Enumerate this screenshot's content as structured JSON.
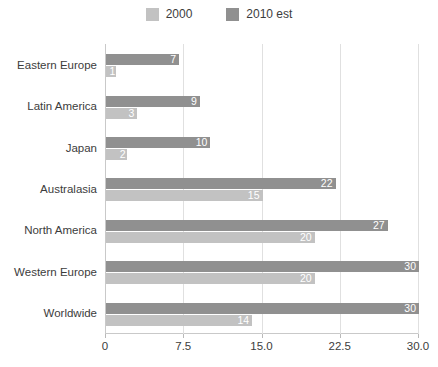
{
  "legend": {
    "entries": [
      {
        "label": "2000",
        "color": "#c2c2c2"
      },
      {
        "label": "2010 est",
        "color": "#909090"
      }
    ]
  },
  "axis": {
    "x_ticks": [
      "0",
      "7.5",
      "15.0",
      "22.5",
      "30.0"
    ]
  },
  "chart_data": {
    "type": "bar",
    "orientation": "horizontal",
    "title": "",
    "xlabel": "",
    "ylabel": "",
    "xlim": [
      0,
      30
    ],
    "grid": true,
    "legend_position": "top-center",
    "categories": [
      "Eastern Europe",
      "Latin America",
      "Japan",
      "Australasia",
      "North America",
      "Western Europe",
      "Worldwide"
    ],
    "series": [
      {
        "name": "2000",
        "color": "#c2c2c2",
        "values": [
          1,
          3,
          2,
          15,
          20,
          20,
          14
        ],
        "labels": [
          "1",
          "3",
          "2",
          "15",
          "20",
          "20",
          "14"
        ]
      },
      {
        "name": "2010 est",
        "color": "#909090",
        "values": [
          7,
          9,
          10,
          22,
          27,
          30,
          30
        ],
        "labels": [
          "7",
          "9",
          "10",
          "22",
          "27",
          "30",
          "30"
        ]
      }
    ]
  }
}
